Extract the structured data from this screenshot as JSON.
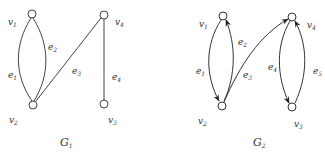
{
  "graphs": [
    {
      "name": "G",
      "sub": "1",
      "directed": false,
      "vertices": [
        {
          "id": "v1",
          "base": "v",
          "sub": "1",
          "x": 32,
          "y": 14
        },
        {
          "id": "v2",
          "base": "v",
          "sub": "2",
          "x": 33,
          "y": 105
        },
        {
          "id": "v3",
          "base": "v",
          "sub": "3",
          "x": 104,
          "y": 104
        },
        {
          "id": "v4",
          "base": "v",
          "sub": "4",
          "x": 104,
          "y": 15
        }
      ],
      "edges": [
        {
          "id": "e1",
          "base": "e",
          "sub": "1",
          "from": "v1",
          "to": "v2"
        },
        {
          "id": "e2",
          "base": "e",
          "sub": "2",
          "from": "v1",
          "to": "v2"
        },
        {
          "id": "e3",
          "base": "e",
          "sub": "3",
          "from": "v2",
          "to": "v4"
        },
        {
          "id": "e4",
          "base": "e",
          "sub": "4",
          "from": "v4",
          "to": "v3"
        }
      ]
    },
    {
      "name": "G",
      "sub": "2",
      "directed": true,
      "vertices": [
        {
          "id": "v1",
          "base": "v",
          "sub": "1",
          "x": 223,
          "y": 16
        },
        {
          "id": "v2",
          "base": "v",
          "sub": "2",
          "x": 222,
          "y": 106
        },
        {
          "id": "v3",
          "base": "v",
          "sub": "3",
          "x": 292,
          "y": 107
        },
        {
          "id": "v4",
          "base": "v",
          "sub": "4",
          "x": 292,
          "y": 17
        }
      ],
      "edges": [
        {
          "id": "e1",
          "base": "e",
          "sub": "1",
          "from": "v1",
          "to": "v2"
        },
        {
          "id": "e2",
          "base": "e",
          "sub": "2",
          "from": "v2",
          "to": "v1"
        },
        {
          "id": "e3",
          "base": "e",
          "sub": "3",
          "from": "v2",
          "to": "v4"
        },
        {
          "id": "e4",
          "base": "e",
          "sub": "4",
          "from": "v4",
          "to": "v3"
        },
        {
          "id": "e5",
          "base": "e",
          "sub": "5",
          "from": "v3",
          "to": "v4"
        }
      ]
    }
  ]
}
